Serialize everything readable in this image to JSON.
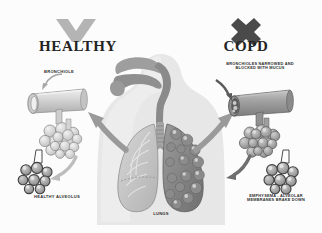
{
  "diagram": {
    "background_color": "#fcfcfc",
    "palette": {
      "ink": "#2b2b2b",
      "body_silhouette": "#e2e2e2",
      "healthy_tissue": "#c8c8c8",
      "diseased_tissue": "#8d8d8d",
      "airway": "#a8a8a8",
      "arrow": "#9a9a9a",
      "check_icon": "#b4b4b4",
      "cross_icon": "#4a4a4a",
      "outline": "#6d6d6d"
    },
    "sides": {
      "healthy": {
        "heading": "HEALTHY",
        "status_icon": "check-icon",
        "status_icon_color": "#b4b4b4",
        "bronchiole_label": "BRONCHIOLE",
        "alveolus_label": "HEALTHY ALVEOLUS"
      },
      "copd": {
        "heading": "COPD",
        "status_icon": "cross-icon",
        "status_icon_color": "#4a4a4a",
        "bronchiole_label": "BRONCHIOLES NARROWED AND\nBLOCKED WITH MUCUS",
        "alveolus_label": "EMPHYSEMA - ALVEOLAR\nMEMBRANES BRAKE DOWN"
      }
    },
    "center": {
      "organ_label": "LUNGS",
      "anatomy": [
        "nasal-cavity",
        "oral-cavity",
        "pharynx",
        "trachea",
        "left-lung-healthy",
        "right-lung-diseased"
      ]
    },
    "callout_arrows": [
      {
        "name": "arrow-lungs-to-healthy-bronchiole",
        "direction": "up-left"
      },
      {
        "name": "arrow-lungs-to-copd-bronchiole",
        "direction": "up-right"
      },
      {
        "name": "arrow-healthy-alveolus-detail",
        "direction": "down-left"
      },
      {
        "name": "arrow-copd-alveolus-detail",
        "direction": "down-left"
      },
      {
        "name": "arrow-pointer-bronchiole",
        "direction": "down-left"
      },
      {
        "name": "arrow-pointer-copd-bronchiole",
        "direction": "down-right"
      }
    ]
  }
}
